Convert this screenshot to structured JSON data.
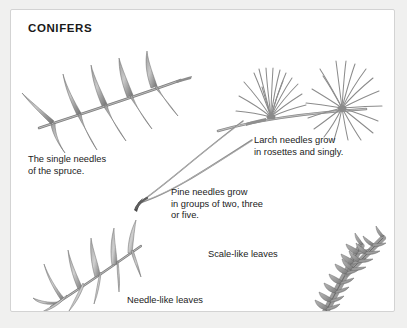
{
  "page": {
    "title": "CONIFERS",
    "background_color": "#f0f0ef",
    "card_color": "#ffffff",
    "border_color": "#d3d3d3",
    "text_color": "#222222",
    "ink_color": "#6e6e6e"
  },
  "captions": {
    "spruce": "The single needles\nof the spruce.",
    "larch": "Larch needles grow\nin rosettes and singly.",
    "pine": "Pine needles grow\nin groups of two, three\nor five.",
    "scale_like": "Scale-like leaves",
    "needle_like": "Needle-like leaves"
  },
  "illustrations": {
    "spruce": "spruce-branch-illustration",
    "larch": "larch-rosette-illustration",
    "pine": "pine-needle-bundle-illustration",
    "needle_like": "needle-like-frond-illustration",
    "scale_like": "scale-like-spray-illustration"
  }
}
